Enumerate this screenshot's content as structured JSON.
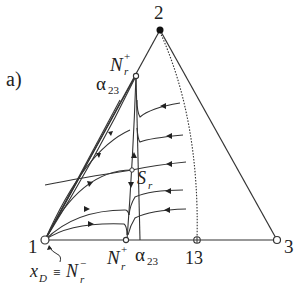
{
  "panel_label": "a)",
  "vertices": {
    "v1": {
      "label": "1"
    },
    "v2": {
      "label": "2"
    },
    "v3": {
      "label": "3"
    }
  },
  "points": {
    "nr_plus_top": {
      "main": "N",
      "sup": "+",
      "sub": "r"
    },
    "alpha23_top": {
      "main": "α",
      "sub": "23"
    },
    "saddle": {
      "main": "S",
      "sub": "r"
    },
    "nr_plus_bottom": {
      "main": "N",
      "sup": "+",
      "sub": "r"
    },
    "alpha23_bottom": {
      "main": "α",
      "sub": "23"
    },
    "azeotrope_13": {
      "label": "13"
    },
    "xd": {
      "main": "x",
      "sub": "D",
      "equiv": "≡",
      "rhs_main": "N",
      "rhs_sup": "−",
      "rhs_sub": "r"
    }
  },
  "colors": {
    "line": "#333333",
    "background": "#ffffff"
  }
}
